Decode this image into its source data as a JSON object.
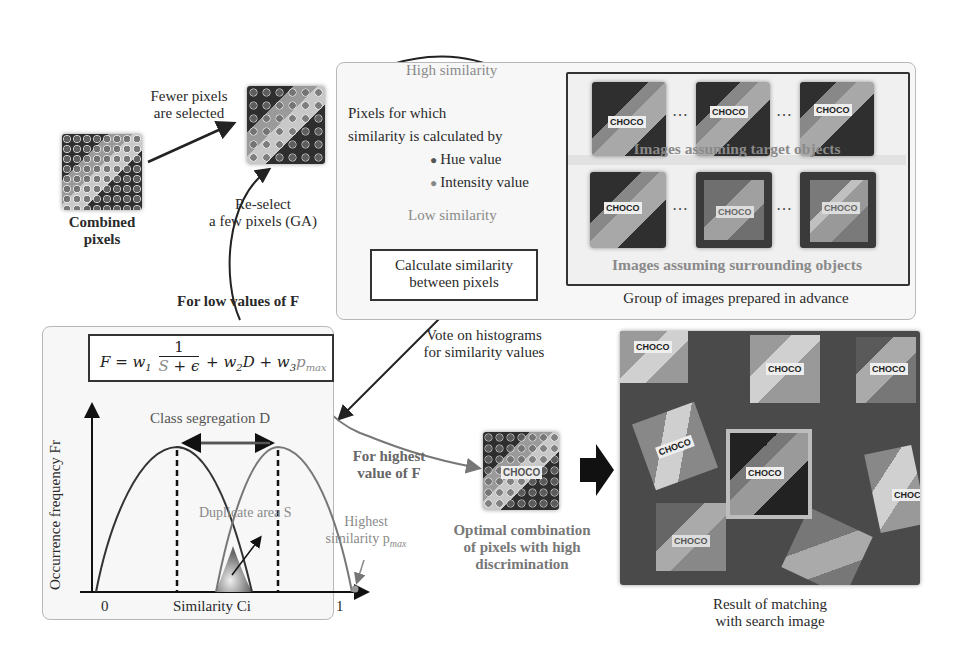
{
  "left": {
    "combined_caption_line1": "Combined",
    "combined_caption_line2": "pixels",
    "fewer_line1": "Fewer pixels",
    "fewer_line2": "are selected",
    "reselect_line1": "Re-select",
    "reselect_line2": "a few pixels (GA)",
    "low_values": "For low values of F"
  },
  "similarity_panel": {
    "high": "High similarity",
    "low": "Low similarity",
    "pixels_line1": "Pixels for which",
    "pixels_line2": "similarity is calculated by",
    "bullets": [
      "Hue value",
      "Intensity value"
    ],
    "calc_line1": "Calculate similarity",
    "calc_line2": "between pixels",
    "target_caption": "Images assuming target objects",
    "surrounding_caption": "Images assuming surrounding objects",
    "group_caption": "Group of images prepared in advance",
    "ellipsis": "…",
    "choco_label": "CHOCO"
  },
  "histogram_panel": {
    "formula_lhs": "F = w",
    "formula_full": "F = w₁ 1/(S + ϵ) + w₂D + w₃p_max",
    "class_segregation": "Class segregation  D",
    "duplicate_area": "Duplicate area S",
    "highest_line1": "Highest",
    "highest_line2": "similarity p",
    "pmax_sub": "max",
    "y_axis": "Occurrence frequency Fr",
    "x_axis": "Similarity Ci",
    "x_min": "0",
    "x_max": "1"
  },
  "vote_line1": "Vote on histograms",
  "vote_line2": "for similarity values",
  "highest_f_line1": "For highest",
  "highest_f_line2": "value of F",
  "optimal_line1": "Optimal combination",
  "optimal_line2": "of pixels with high",
  "optimal_line3": "discrimination",
  "result_line1": "Result of matching",
  "result_line2": "with search image",
  "colors": {
    "accent_gray": "#8a8a8a",
    "dark": "#222222",
    "panel_bg": "#f7f7f7",
    "box_dark": "#3a3a3a",
    "box_mid": "#7a7a7a",
    "box_light": "#b0b0b0"
  }
}
